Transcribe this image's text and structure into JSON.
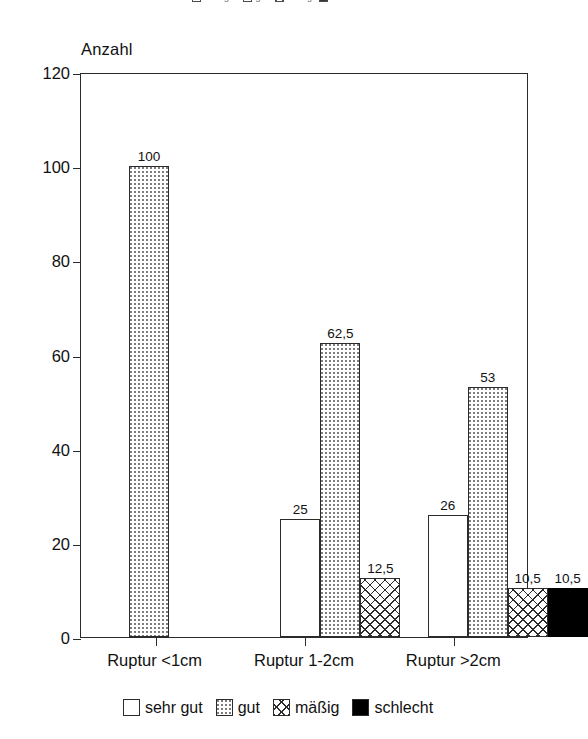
{
  "chart_data": {
    "type": "bar",
    "title": "",
    "subtitle": "",
    "xlabel": "",
    "ylabel": "Anzahl",
    "ylim": [
      0,
      120
    ],
    "yticks": [
      "0",
      "20",
      "40",
      "60",
      "80",
      "100",
      "120"
    ],
    "ytick_values": [
      0,
      20,
      40,
      60,
      80,
      100,
      120
    ],
    "grid": false,
    "legend_position": "bottom",
    "categories": [
      "Ruptur <1cm",
      "Ruptur 1-2cm",
      "Ruptur >2cm"
    ],
    "series": [
      {
        "name": "sehr gut",
        "fill": "white",
        "values": [
          null,
          25,
          26
        ],
        "labels": [
          "",
          "25",
          "26"
        ]
      },
      {
        "name": "gut",
        "fill": "dotted",
        "values": [
          100,
          62.5,
          53
        ],
        "labels": [
          "100",
          "62,5",
          "53"
        ]
      },
      {
        "name": "mäßig",
        "fill": "crosshatch",
        "values": [
          null,
          12.5,
          10.5
        ],
        "labels": [
          "",
          "12,5",
          "10,5"
        ]
      },
      {
        "name": "schlecht",
        "fill": "solid-black",
        "values": [
          null,
          null,
          10.5
        ],
        "labels": [
          "",
          "",
          "10,5"
        ]
      }
    ]
  },
  "axis": {
    "y_title": "Anzahl"
  },
  "legend_top": {
    "items": [
      {
        "label": "sehr gut",
        "fill": "white"
      },
      {
        "label": "gut",
        "fill": "dotted"
      },
      {
        "label": "mäßig",
        "fill": "crosshatch"
      },
      {
        "label": "schlecht",
        "fill": "solid-black"
      }
    ]
  },
  "legend_bottom": {
    "items": [
      {
        "label": "sehr gut",
        "fill": "white"
      },
      {
        "label": "gut",
        "fill": "dotted"
      },
      {
        "label": "mäßig",
        "fill": "crosshatch"
      },
      {
        "label": "schlecht",
        "fill": "solid-black"
      }
    ]
  },
  "colors": {
    "axis": "#2b2b2b",
    "text": "#111111",
    "background": "#ffffff",
    "pattern": "#2b2b2b",
    "schlecht": "#000000"
  }
}
